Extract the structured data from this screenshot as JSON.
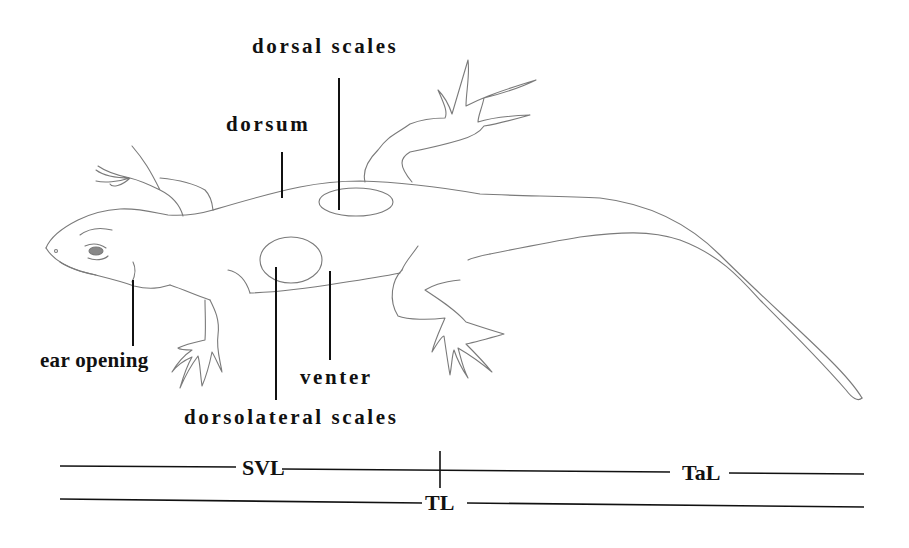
{
  "figure": {
    "type": "lizard morphology line drawing",
    "colors": {
      "outline": "#7a7a7a",
      "pointer": "#111111",
      "text": "#111111",
      "background": "#ffffff"
    },
    "labels": {
      "dorsal_scales": "dorsal scales",
      "dorsum": "dorsum",
      "ear_opening": "ear opening",
      "venter": "venter",
      "dorsolateral_scales": "dorsolateral scales"
    },
    "measurements": {
      "svl": "SVL",
      "tal": "TaL",
      "tl": "TL"
    }
  }
}
